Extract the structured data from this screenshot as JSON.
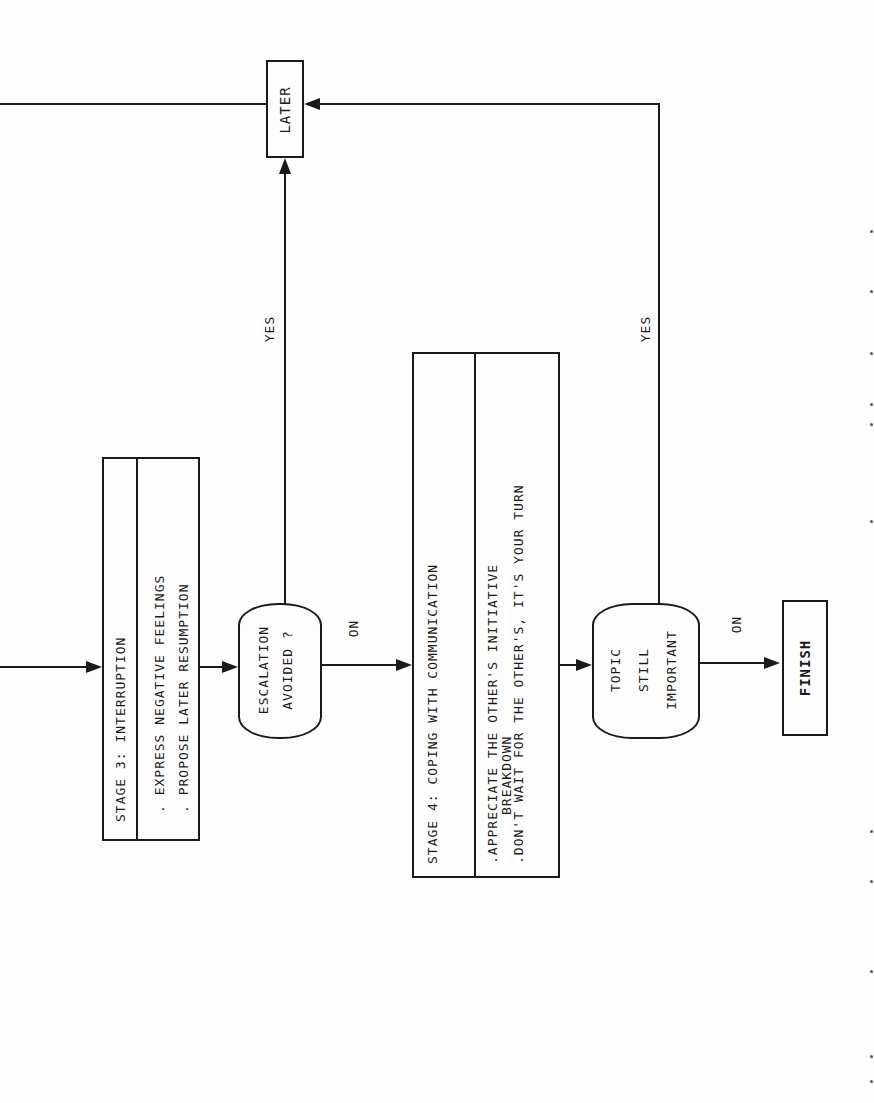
{
  "orientation": "rotated-90-ccw",
  "nodes": {
    "later": {
      "label": "LATER"
    },
    "stage3": {
      "title": "STAGE 3: INTERRUPTION",
      "items": [
        ". EXPRESS NEGATIVE FEELINGS",
        ". PROPOSE LATER RESUMPTION"
      ]
    },
    "escalation": {
      "line1": "ESCALATION",
      "line2": "AVOIDED ?"
    },
    "stage4": {
      "title_line1": "STAGE 4: COPING WITH COMMUNICATION",
      "title_line2": "BREAKDOWN",
      "items": [
        ".APPRECIATE THE OTHER'S INITIATIVE",
        ".DON'T WAIT FOR THE OTHER'S, IT'S YOUR TURN"
      ]
    },
    "topic": {
      "line1": "TOPIC",
      "line2": "STILL",
      "line3": "IMPORTANT"
    },
    "finish": {
      "label": "FINISH"
    }
  },
  "edges": {
    "escalation_yes": "YES",
    "escalation_no": "NO",
    "topic_yes": "YES",
    "topic_no": "NO"
  },
  "colors": {
    "ink": "#1a1a1a",
    "paper": "#fdfdfd"
  }
}
